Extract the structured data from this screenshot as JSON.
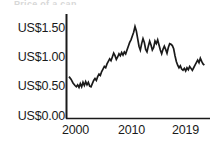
{
  "figure": {
    "title_remnant": "Price of a can",
    "background_color": "#ffffff",
    "line_color": "#1a1a1a",
    "axis_color": "#1a1a1a"
  },
  "chart_data": {
    "type": "line",
    "title": "",
    "xlabel": "",
    "ylabel": "",
    "currency": "US$",
    "ylim": [
      0.0,
      1.6
    ],
    "xlim": [
      1998.5,
      2019.5
    ],
    "grid": false,
    "legend": null,
    "y_ticks": [
      0.0,
      0.5,
      1.0,
      1.5
    ],
    "y_tick_labels": [
      "US$0.00",
      "US$0.50",
      "US$1.00",
      "US$1.50"
    ],
    "x_ticks": [
      2000,
      2010,
      2019
    ],
    "x_tick_labels": [
      "2000",
      "2010",
      "2019"
    ],
    "series": [
      {
        "name": "price",
        "x": [
          1998.8,
          1999.1,
          1999.4,
          1999.7,
          1999.9,
          2000.1,
          2000.3,
          2000.5,
          2000.7,
          2000.9,
          2001.1,
          2001.3,
          2001.5,
          2001.7,
          2001.9,
          2002.1,
          2002.3,
          2002.5,
          2002.7,
          2002.9,
          2003.1,
          2003.3,
          2003.5,
          2003.7,
          2003.9,
          2004.1,
          2004.3,
          2004.5,
          2004.7,
          2004.9,
          2005.1,
          2005.3,
          2005.5,
          2005.7,
          2005.9,
          2006.1,
          2006.3,
          2006.5,
          2006.7,
          2006.9,
          2007.1,
          2007.3,
          2007.5,
          2007.7,
          2007.9,
          2008.1,
          2008.3,
          2008.5,
          2008.7,
          2008.9,
          2009.1,
          2009.3,
          2009.5,
          2009.7,
          2009.9,
          2010.1,
          2010.3,
          2010.5,
          2010.7,
          2010.9,
          2011.1,
          2011.3,
          2011.5,
          2011.7,
          2011.9,
          2012.1,
          2012.3,
          2012.5,
          2012.7,
          2012.9,
          2013.1,
          2013.3,
          2013.5,
          2013.7,
          2013.9,
          2014.1,
          2014.3,
          2014.5,
          2014.7,
          2014.9,
          2015.1,
          2015.3,
          2015.5,
          2015.7,
          2015.9,
          2016.1,
          2016.3,
          2016.5,
          2016.7,
          2016.9,
          2017.1,
          2017.3,
          2017.5,
          2017.7,
          2017.9,
          2018.1,
          2018.3,
          2018.5,
          2018.7,
          2018.9,
          2019.1
        ],
        "y": [
          0.66,
          0.62,
          0.56,
          0.52,
          0.5,
          0.53,
          0.49,
          0.55,
          0.5,
          0.57,
          0.52,
          0.58,
          0.53,
          0.57,
          0.51,
          0.5,
          0.55,
          0.6,
          0.63,
          0.6,
          0.66,
          0.7,
          0.68,
          0.74,
          0.78,
          0.82,
          0.8,
          0.86,
          0.9,
          0.94,
          0.91,
          0.97,
          1.03,
          0.99,
          0.93,
          0.97,
          1.02,
          0.99,
          1.04,
          1.0,
          1.05,
          1.02,
          1.08,
          1.14,
          1.2,
          1.24,
          1.3,
          1.36,
          1.45,
          1.38,
          1.26,
          1.14,
          1.08,
          1.18,
          1.26,
          1.2,
          1.09,
          1.05,
          1.14,
          1.22,
          1.16,
          1.08,
          1.12,
          1.22,
          1.18,
          1.24,
          1.16,
          1.08,
          1.02,
          1.09,
          1.14,
          1.09,
          1.03,
          1.12,
          1.18,
          1.17,
          1.15,
          1.1,
          0.99,
          0.9,
          0.84,
          0.8,
          0.83,
          0.78,
          0.76,
          0.79,
          0.75,
          0.8,
          0.77,
          0.82,
          0.79,
          0.76,
          0.8,
          0.84,
          0.88,
          0.92,
          0.88,
          0.95,
          0.9,
          0.86,
          0.84
        ]
      }
    ]
  },
  "axes": {
    "y_tick_labels": [
      {
        "text": "US$1.50",
        "top_px": 22
      },
      {
        "text": "US$1.00",
        "top_px": 51
      },
      {
        "text": "US$0.50",
        "top_px": 80
      },
      {
        "text": "US$0.00",
        "top_px": 110
      }
    ],
    "x_tick_labels": [
      {
        "text": "2000",
        "left_px": 62
      },
      {
        "text": "2010",
        "left_px": 118
      },
      {
        "text": "2019",
        "left_px": 172
      }
    ]
  }
}
